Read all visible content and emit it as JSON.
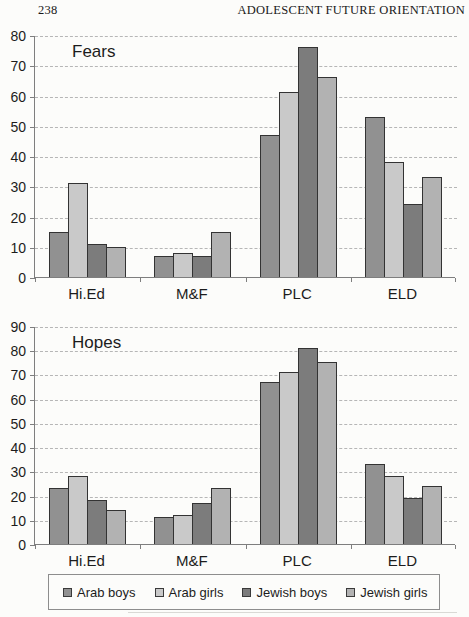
{
  "header": {
    "page_number": "238",
    "running_title": "ADOLESCENT FUTURE ORIENTATION"
  },
  "legend": {
    "items": [
      {
        "label": "Arab boys",
        "color": "#919191"
      },
      {
        "label": "Arab girls",
        "color": "#c9c9c9"
      },
      {
        "label": "Jewish boys",
        "color": "#7c7c7c"
      },
      {
        "label": "Jewish girls",
        "color": "#b2b2b2"
      }
    ]
  },
  "chart_data": [
    {
      "type": "bar",
      "title": "Fears",
      "categories": [
        "Hi.Ed",
        "M&F",
        "PLC",
        "ELD"
      ],
      "series": [
        {
          "name": "Arab boys",
          "values": [
            15,
            7,
            47,
            53
          ]
        },
        {
          "name": "Arab girls",
          "values": [
            31,
            8,
            61,
            38
          ]
        },
        {
          "name": "Jewish boys",
          "values": [
            11,
            7,
            76,
            24
          ]
        },
        {
          "name": "Jewish girls",
          "values": [
            10,
            15,
            66,
            33
          ]
        }
      ],
      "xlabel": "",
      "ylabel": "",
      "ylim": [
        0,
        80
      ],
      "yticks": [
        0,
        10,
        20,
        30,
        40,
        50,
        60,
        70,
        80
      ],
      "grid": "horizontal dashed",
      "legend_position": "shared bottom"
    },
    {
      "type": "bar",
      "title": "Hopes",
      "categories": [
        "Hi.Ed",
        "M&F",
        "PLC",
        "ELD"
      ],
      "series": [
        {
          "name": "Arab boys",
          "values": [
            23,
            11,
            67,
            33
          ]
        },
        {
          "name": "Arab girls",
          "values": [
            28,
            12,
            71,
            28
          ]
        },
        {
          "name": "Jewish boys",
          "values": [
            18,
            17,
            81,
            19
          ]
        },
        {
          "name": "Jewish girls",
          "values": [
            14,
            23,
            75,
            24
          ]
        }
      ],
      "xlabel": "",
      "ylabel": "",
      "ylim": [
        0,
        90
      ],
      "yticks": [
        0,
        10,
        20,
        30,
        40,
        50,
        60,
        70,
        80,
        90
      ],
      "grid": "horizontal dashed",
      "legend_position": "shared bottom"
    }
  ]
}
